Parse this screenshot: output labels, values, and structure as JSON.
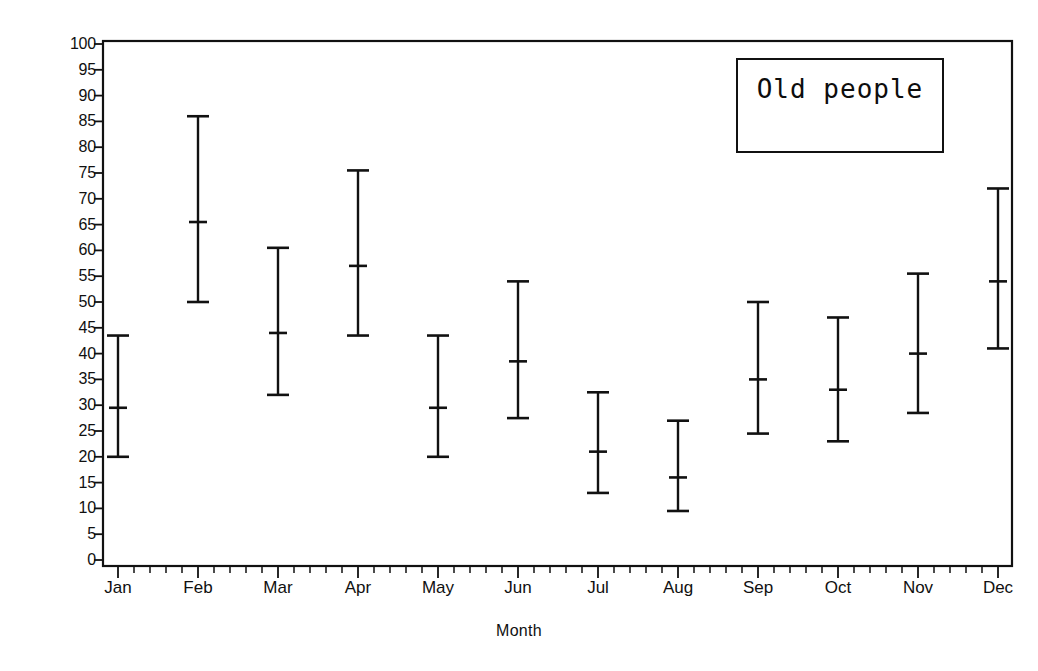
{
  "chart_data": {
    "type": "errorbar",
    "title": "",
    "xlabel": "Month",
    "ylabel": "Crude Death Rate",
    "legend_label": "Old people",
    "legend_position": "top-right",
    "grid": false,
    "xlim": [
      0,
      12
    ],
    "ylim": [
      0,
      100
    ],
    "ytick_step": 5,
    "ytick_labels": [
      "0",
      "5",
      "10",
      "15",
      "20",
      "25",
      "30",
      "35",
      "40",
      "45",
      "50",
      "55",
      "60",
      "65",
      "70",
      "75",
      "80",
      "85",
      "90",
      "95",
      "100"
    ],
    "categories": [
      "Jan",
      "Feb",
      "Mar",
      "Apr",
      "May",
      "Jun",
      "Jul",
      "Aug",
      "Sep",
      "Oct",
      "Nov",
      "Dec"
    ],
    "x_minor_ticks_per_interval": 4,
    "series": [
      {
        "name": "Old people",
        "marker": "horizontal-dash",
        "color": "#111111",
        "points": [
          {
            "category": "Jan",
            "mean": 29.5,
            "low": 20.0,
            "high": 43.5
          },
          {
            "category": "Feb",
            "mean": 65.5,
            "low": 50.0,
            "high": 86.0
          },
          {
            "category": "Mar",
            "mean": 44.0,
            "low": 32.0,
            "high": 60.5
          },
          {
            "category": "Apr",
            "mean": 57.0,
            "low": 43.5,
            "high": 75.5
          },
          {
            "category": "May",
            "mean": 29.5,
            "low": 20.0,
            "high": 43.5
          },
          {
            "category": "Jun",
            "mean": 38.5,
            "low": 27.5,
            "high": 54.0
          },
          {
            "category": "Jul",
            "mean": 21.0,
            "low": 13.0,
            "high": 32.5
          },
          {
            "category": "Aug",
            "mean": 16.0,
            "low": 9.5,
            "high": 27.0
          },
          {
            "category": "Sep",
            "mean": 35.0,
            "low": 24.5,
            "high": 50.0
          },
          {
            "category": "Oct",
            "mean": 33.0,
            "low": 23.0,
            "high": 47.0
          },
          {
            "category": "Nov",
            "mean": 40.0,
            "low": 28.5,
            "high": 55.5
          },
          {
            "category": "Dec",
            "mean": 54.0,
            "low": 41.0,
            "high": 72.0
          }
        ]
      }
    ]
  },
  "style": {
    "axis_color": "#111111",
    "series_color": "#111111",
    "background": "#ffffff",
    "text_color": "#101010"
  }
}
